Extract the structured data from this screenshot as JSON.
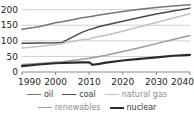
{
  "chart_data": {
    "type": "line",
    "title": "",
    "xlabel": "",
    "ylabel": "",
    "xlim": [
      1990,
      2040
    ],
    "ylim": [
      0,
      215
    ],
    "grid": true,
    "legend_position": "bottom",
    "xticks": [
      "1990",
      "2000",
      "2010",
      "2020",
      "2030",
      "2040"
    ],
    "yticks": [
      "0",
      "50",
      "100",
      "150",
      "200"
    ],
    "x": [
      1990,
      1995,
      2000,
      2002,
      2005,
      2008,
      2010,
      2011,
      2013,
      2015,
      2020,
      2025,
      2030,
      2035,
      2040
    ],
    "series": [
      {
        "name": "oil",
        "color": "#767676",
        "width": 1.5,
        "values": [
          137,
          145,
          158,
          161,
          168,
          174,
          177,
          179,
          183,
          186,
          194,
          201,
          207,
          212,
          216
        ]
      },
      {
        "name": "coal",
        "color": "#4a4a4a",
        "width": 1.5,
        "values": [
          92,
          93,
          94,
          95,
          112,
          128,
          136,
          139,
          146,
          151,
          163,
          175,
          186,
          196,
          205
        ]
      },
      {
        "name": "natural gas",
        "color": "#c2c2c2",
        "width": 1.5,
        "values": [
          77,
          82,
          88,
          91,
          98,
          104,
          105,
          110,
          114,
          118,
          131,
          145,
          159,
          173,
          187
        ]
      },
      {
        "name": "renewables",
        "color": "#9b9b9b",
        "width": 1.5,
        "values": [
          24,
          27,
          31,
          33,
          37,
          41,
          44,
          46,
          50,
          54,
          66,
          78,
          91,
          104,
          117
        ]
      },
      {
        "name": "nuclear",
        "color": "#2b2b2b",
        "width": 2.1,
        "values": [
          19,
          24,
          28,
          29,
          30,
          31,
          31,
          23,
          26,
          30,
          37,
          42,
          47,
          52,
          55
        ]
      }
    ]
  },
  "legend": {
    "row1": [
      {
        "label": "oil",
        "color": "#767676",
        "width": "1.6px"
      },
      {
        "label": "coal",
        "color": "#4a4a4a",
        "width": "1.6px"
      },
      {
        "label": "natural gas",
        "color": "#c2c2c2",
        "width": "1.6px"
      }
    ],
    "row2": [
      {
        "label": "renewables",
        "color": "#9b9b9b",
        "width": "1.6px"
      },
      {
        "label": "nuclear",
        "color": "#2b2b2b",
        "width": "2.2px"
      }
    ]
  }
}
